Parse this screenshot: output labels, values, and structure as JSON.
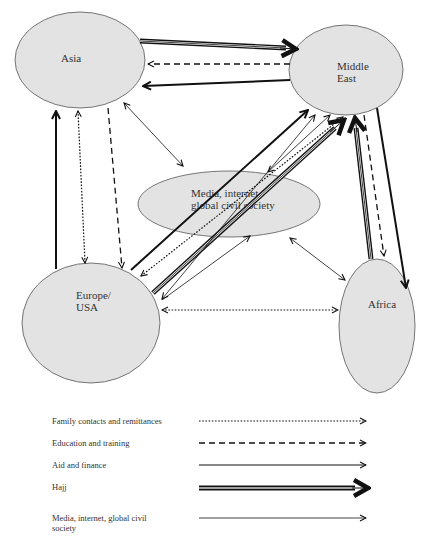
{
  "nodes": {
    "asia": {
      "label": "Asia"
    },
    "middle_east": {
      "label_line1": "Middle",
      "label_line2": "East"
    },
    "media": {
      "label_line1": "Media, internet,",
      "label_line2": "global civil society"
    },
    "europe": {
      "label_line1": "Europe/",
      "label_line2": "USA"
    },
    "africa": {
      "label": "Africa"
    }
  },
  "legend": {
    "items": [
      {
        "label": "Family contacts and remittances",
        "style": "dotted"
      },
      {
        "label": "Education and training",
        "style": "dashed"
      },
      {
        "label": "Aid and finance",
        "style": "solid"
      },
      {
        "label": "Hajj",
        "style": "triple-line-bold-head"
      },
      {
        "label": "Media, internet, global civil society",
        "style": "thin"
      }
    ]
  },
  "colors": {
    "node_fill": "#e3e3e3",
    "node_stroke": "#555555",
    "arrow": "#111111"
  },
  "flows": [
    {
      "from": "Asia",
      "to": "Middle East",
      "type": "Hajj"
    },
    {
      "from": "Middle East",
      "to": "Asia",
      "type": "Education and training"
    },
    {
      "from": "Middle East",
      "to": "Asia",
      "type": "Aid and finance"
    },
    {
      "from": "Asia",
      "to": "Media, internet, global civil society",
      "type": "Media, internet, global civil society",
      "bidirectional": true
    },
    {
      "from": "Europe/USA",
      "to": "Asia",
      "type": "Aid and finance"
    },
    {
      "from": "Asia",
      "to": "Europe/USA",
      "type": "Family contacts and remittances",
      "bidirectional": true
    },
    {
      "from": "Asia",
      "to": "Europe/USA",
      "type": "Education and training"
    },
    {
      "from": "Europe/USA",
      "to": "Middle East",
      "type": "Aid and finance"
    },
    {
      "from": "Europe/USA",
      "to": "Middle East",
      "type": "Family contacts and remittances",
      "bidirectional": true
    },
    {
      "from": "Europe/USA",
      "to": "Middle East",
      "type": "Hajj"
    },
    {
      "from": "Europe/USA",
      "to": "Middle East",
      "type": "Media, internet, global civil society",
      "bidirectional": true
    },
    {
      "from": "Europe/USA",
      "to": "Media, internet, global civil society",
      "type": "Media, internet, global civil society",
      "bidirectional": true
    },
    {
      "from": "Europe/USA",
      "to": "Africa",
      "type": "Family contacts and remittances",
      "bidirectional": true
    },
    {
      "from": "Media, internet, global civil society",
      "to": "Middle East",
      "type": "Media, internet, global civil society",
      "bidirectional": true
    },
    {
      "from": "Media, internet, global civil society",
      "to": "Africa",
      "type": "Media, internet, global civil society",
      "bidirectional": true
    },
    {
      "from": "Africa",
      "to": "Middle East",
      "type": "Hajj"
    },
    {
      "from": "Middle East",
      "to": "Africa",
      "type": "Education and training"
    },
    {
      "from": "Middle East",
      "to": "Africa",
      "type": "Aid and finance"
    }
  ]
}
